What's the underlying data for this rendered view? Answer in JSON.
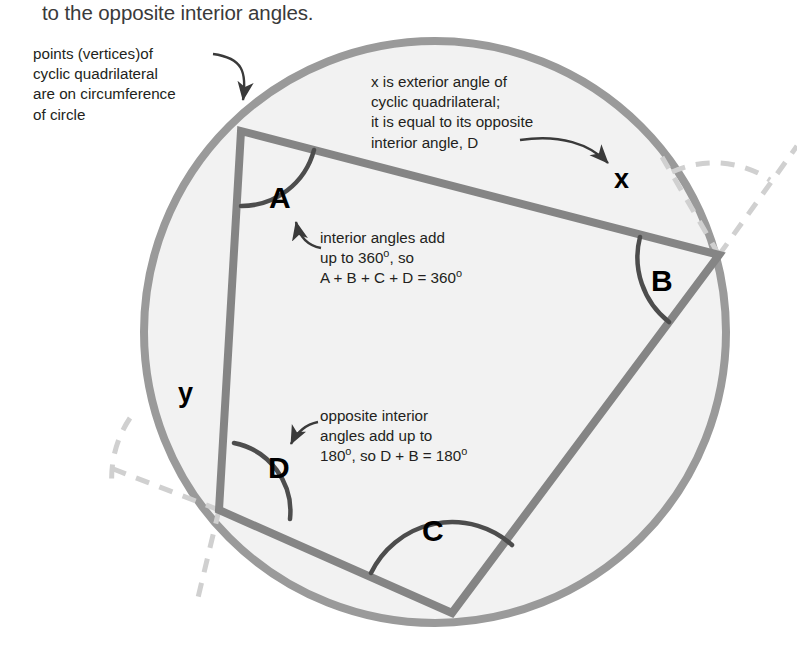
{
  "page": {
    "width": 797,
    "height": 647,
    "background": "#ffffff"
  },
  "heading": {
    "text": "to the opposite interior angles."
  },
  "callouts": {
    "vertices": {
      "lines": [
        "points (vertices)of",
        "cyclic quadrilateral",
        "are on circumference",
        "of circle"
      ],
      "text": "points (vertices)of\ncyclic quadrilateral\nare on circumference\nof circle"
    },
    "exterior_angle": {
      "lines": [
        "x is exterior angle of",
        "cyclic quadrilateral;",
        "it is equal to its opposite",
        "interior angle, D"
      ],
      "text": "x is exterior angle of\ncyclic quadrilateral;\nit is equal to its opposite\ninterior angle, D"
    },
    "interior_sum": {
      "line1": "interior angles add",
      "line2_pre": "up to 360",
      "line2_post": ", so",
      "line3_pre": "A + B + C + D = 360",
      "degree": "o"
    },
    "opposite_sum": {
      "line1": "opposite interior",
      "line2": "angles add up to",
      "line3_pre": "180",
      "line3_mid": ", so D + B = 180",
      "degree": "o"
    }
  },
  "angle_labels": {
    "A": "A",
    "B": "B",
    "C": "C",
    "D": "D",
    "x": "x",
    "y": "y"
  },
  "colors": {
    "circle_stroke": "#969696",
    "circle_fill": "#f2f2f2",
    "quad_stroke": "#808080",
    "dashed_stroke": "#cfcfcf",
    "arc_stroke": "#555555",
    "text": "#231f20",
    "heading_text": "#3a3a3a",
    "arrow": "#3a3a3a"
  },
  "geometry": {
    "circle": {
      "cx": 435,
      "cy": 332,
      "r": 291
    },
    "vertices": {
      "A": {
        "x": 241,
        "y": 131
      },
      "B": {
        "x": 719,
        "y": 255
      },
      "C": {
        "x": 452,
        "y": 613
      },
      "D": {
        "x": 219,
        "y": 510
      }
    }
  }
}
